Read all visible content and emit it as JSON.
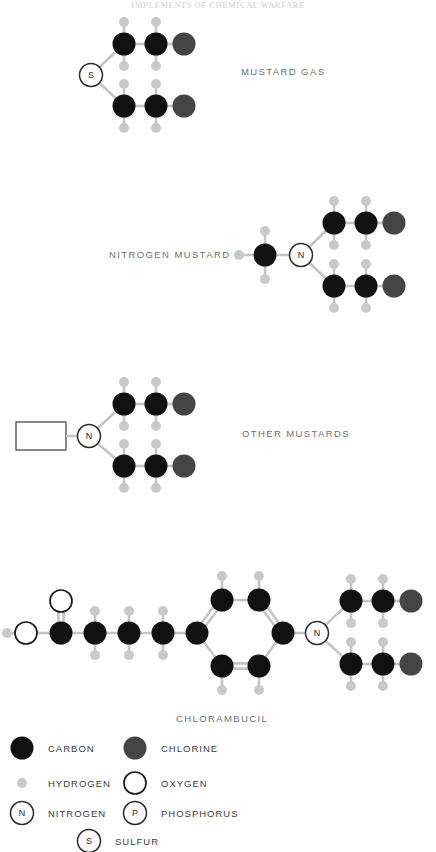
{
  "page": {
    "background": "#ffffff",
    "ghost_header": "IMPLEMENTS OF CHEMICAL WARFARE"
  },
  "palette": {
    "carbon": "#111111",
    "hydrogen": "#c9c9c9",
    "chlorine": "#454545",
    "oxygen_outline": "#1a1a1a",
    "nitrogen_outline": "#2a2a2a",
    "sulfur_outline": "#2a2a2a",
    "bond": "#c4c4c4",
    "bond_dark": "#8d8d8d",
    "label_text": "#6f6f6f",
    "legend_text": "#3b3b3b"
  },
  "molecules": [
    {
      "id": "mustard-gas",
      "label": "MUSTARD GAS",
      "label_x": 241,
      "label_y": 75
    },
    {
      "id": "nitrogen-mustard",
      "label": "NITROGEN MUSTARD",
      "label_x": 109,
      "label_y": 258
    },
    {
      "id": "other-mustards",
      "label": "OTHER MUSTARDS",
      "label_x": 242,
      "label_y": 437
    },
    {
      "id": "chlorambucil",
      "label": "CHLORAMBUCIL",
      "label_x": 176,
      "label_y": 722
    }
  ],
  "atom_letters": {
    "sulfur": "S",
    "nitrogen": "N",
    "phosphorus": "P"
  },
  "legend": {
    "items": [
      {
        "key": "carbon",
        "label": "CARBON",
        "glyph": "filled-circle-dark",
        "x": 22,
        "y": 748,
        "text_x": 48,
        "text_y": 752
      },
      {
        "key": "chlorine",
        "label": "CHLORINE",
        "glyph": "filled-circle-gray",
        "x": 135,
        "y": 748,
        "text_x": 161,
        "text_y": 752
      },
      {
        "key": "hydrogen",
        "label": "HYDROGEN",
        "glyph": "small-circle-gray",
        "x": 22,
        "y": 783,
        "text_x": 48,
        "text_y": 787
      },
      {
        "key": "oxygen",
        "label": "OXYGEN",
        "glyph": "open-circle",
        "x": 135,
        "y": 783,
        "text_x": 161,
        "text_y": 787
      },
      {
        "key": "nitrogen",
        "label": "NITROGEN",
        "glyph": "lettered-circle-N",
        "x": 22,
        "y": 813,
        "text_x": 48,
        "text_y": 817
      },
      {
        "key": "phosphorus",
        "label": "PHOSPHORUS",
        "glyph": "lettered-circle-P",
        "x": 135,
        "y": 813,
        "text_x": 161,
        "text_y": 817
      },
      {
        "key": "sulfur",
        "label": "SULFUR",
        "glyph": "lettered-circle-S",
        "x": 89,
        "y": 841,
        "text_x": 115,
        "text_y": 845
      }
    ]
  },
  "chart_data": {
    "type": "diagram",
    "structures": [
      {
        "name": "MUSTARD GAS",
        "formula": "S(CH2CH2Cl)2",
        "atoms": [
          {
            "el": "S",
            "x": 91,
            "y": 75
          },
          {
            "el": "C",
            "x": 124,
            "y": 44
          },
          {
            "el": "H",
            "x": 124,
            "y": 20
          },
          {
            "el": "H",
            "x": 124,
            "y": 66
          },
          {
            "el": "C",
            "x": 156,
            "y": 44
          },
          {
            "el": "H",
            "x": 156,
            "y": 20
          },
          {
            "el": "H",
            "x": 156,
            "y": 66
          },
          {
            "el": "Cl",
            "x": 184,
            "y": 44
          },
          {
            "el": "C",
            "x": 124,
            "y": 106
          },
          {
            "el": "H",
            "x": 124,
            "y": 84
          },
          {
            "el": "H",
            "x": 124,
            "y": 130
          },
          {
            "el": "C",
            "x": 156,
            "y": 106
          },
          {
            "el": "H",
            "x": 156,
            "y": 84
          },
          {
            "el": "H",
            "x": 156,
            "y": 130
          },
          {
            "el": "Cl",
            "x": 184,
            "y": 106
          }
        ]
      },
      {
        "name": "NITROGEN MUSTARD",
        "formula": "CH3-N(CH2CH2Cl)2",
        "atoms": [
          {
            "el": "C",
            "x": 265,
            "y": 255
          },
          {
            "el": "H",
            "x": 239,
            "y": 255
          },
          {
            "el": "H",
            "x": 265,
            "y": 231
          },
          {
            "el": "H",
            "x": 265,
            "y": 279
          },
          {
            "el": "N",
            "x": 301,
            "y": 255
          },
          {
            "el": "C",
            "x": 334,
            "y": 223
          },
          {
            "el": "H",
            "x": 334,
            "y": 199
          },
          {
            "el": "H",
            "x": 334,
            "y": 245
          },
          {
            "el": "C",
            "x": 366,
            "y": 223
          },
          {
            "el": "H",
            "x": 366,
            "y": 199
          },
          {
            "el": "H",
            "x": 366,
            "y": 245
          },
          {
            "el": "Cl",
            "x": 394,
            "y": 223
          },
          {
            "el": "C",
            "x": 334,
            "y": 286
          },
          {
            "el": "H",
            "x": 334,
            "y": 264
          },
          {
            "el": "H",
            "x": 334,
            "y": 310
          },
          {
            "el": "C",
            "x": 366,
            "y": 286
          },
          {
            "el": "H",
            "x": 366,
            "y": 264
          },
          {
            "el": "H",
            "x": 366,
            "y": 310
          },
          {
            "el": "Cl",
            "x": 394,
            "y": 286
          }
        ]
      },
      {
        "name": "OTHER MUSTARDS",
        "formula": "R-N(CH2CH2Cl)2",
        "r_group_box": {
          "x": 16,
          "y": 422,
          "w": 50,
          "h": 28
        },
        "atoms": [
          {
            "el": "N",
            "x": 89,
            "y": 436
          },
          {
            "el": "C",
            "x": 124,
            "y": 404
          },
          {
            "el": "H",
            "x": 124,
            "y": 380
          },
          {
            "el": "H",
            "x": 124,
            "y": 426
          },
          {
            "el": "C",
            "x": 156,
            "y": 404
          },
          {
            "el": "H",
            "x": 156,
            "y": 380
          },
          {
            "el": "H",
            "x": 156,
            "y": 426
          },
          {
            "el": "Cl",
            "x": 184,
            "y": 404
          },
          {
            "el": "C",
            "x": 124,
            "y": 466
          },
          {
            "el": "H",
            "x": 124,
            "y": 444
          },
          {
            "el": "H",
            "x": 124,
            "y": 490
          },
          {
            "el": "C",
            "x": 156,
            "y": 466
          },
          {
            "el": "H",
            "x": 156,
            "y": 444
          },
          {
            "el": "H",
            "x": 156,
            "y": 490
          },
          {
            "el": "Cl",
            "x": 184,
            "y": 466
          }
        ]
      },
      {
        "name": "CHLORAMBUCIL",
        "formula": "HOOC-(CH2)3-C6H4-N(CH2CH2Cl)2",
        "atoms": [
          {
            "el": "H",
            "x": 7,
            "y": 633
          },
          {
            "el": "O",
            "x": 26,
            "y": 633
          },
          {
            "el": "C",
            "x": 61,
            "y": 633
          },
          {
            "el": "O",
            "x": 61,
            "y": 601
          },
          {
            "el": "C",
            "x": 95,
            "y": 633
          },
          {
            "el": "H",
            "x": 95,
            "y": 609
          },
          {
            "el": "H",
            "x": 95,
            "y": 657
          },
          {
            "el": "C",
            "x": 129,
            "y": 633
          },
          {
            "el": "H",
            "x": 129,
            "y": 609
          },
          {
            "el": "H",
            "x": 129,
            "y": 657
          },
          {
            "el": "C",
            "x": 163,
            "y": 633
          },
          {
            "el": "H",
            "x": 163,
            "y": 609
          },
          {
            "el": "H",
            "x": 163,
            "y": 657
          },
          {
            "el": "C",
            "x": 197,
            "y": 633
          },
          {
            "el": "C",
            "x": 222,
            "y": 600
          },
          {
            "el": "H",
            "x": 222,
            "y": 576
          },
          {
            "el": "C",
            "x": 259,
            "y": 600
          },
          {
            "el": "H",
            "x": 259,
            "y": 576
          },
          {
            "el": "C",
            "x": 283,
            "y": 633
          },
          {
            "el": "C",
            "x": 259,
            "y": 666
          },
          {
            "el": "H",
            "x": 259,
            "y": 690
          },
          {
            "el": "C",
            "x": 222,
            "y": 666
          },
          {
            "el": "H",
            "x": 222,
            "y": 690
          },
          {
            "el": "N",
            "x": 317,
            "y": 633
          },
          {
            "el": "C",
            "x": 351,
            "y": 601
          },
          {
            "el": "H",
            "x": 351,
            "y": 577
          },
          {
            "el": "H",
            "x": 351,
            "y": 623
          },
          {
            "el": "C",
            "x": 383,
            "y": 601
          },
          {
            "el": "H",
            "x": 383,
            "y": 577
          },
          {
            "el": "H",
            "x": 383,
            "y": 623
          },
          {
            "el": "Cl",
            "x": 411,
            "y": 601
          },
          {
            "el": "C",
            "x": 351,
            "y": 664
          },
          {
            "el": "H",
            "x": 351,
            "y": 642
          },
          {
            "el": "H",
            "x": 351,
            "y": 688
          },
          {
            "el": "C",
            "x": 383,
            "y": 664
          },
          {
            "el": "H",
            "x": 383,
            "y": 642
          },
          {
            "el": "H",
            "x": 383,
            "y": 688
          },
          {
            "el": "Cl",
            "x": 411,
            "y": 664
          }
        ]
      }
    ]
  }
}
